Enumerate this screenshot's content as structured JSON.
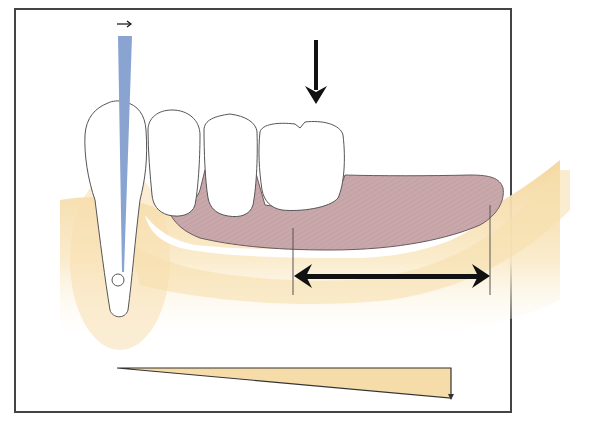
{
  "figure": {
    "colors": {
      "frame": "#444444",
      "bone": "#f6dfae",
      "bone_light": "#fbefd2",
      "denture_base": "#c8a6aa",
      "denture_outline": "#6a5a5e",
      "tooth_fill": "#ffffff",
      "tooth_outline": "#555555",
      "post_blue": "#8aa4d2",
      "arrow": "#111111",
      "wedge_fill": "#f6dca9"
    },
    "elements": {
      "abutment_tooth": "Abutment tooth with root",
      "rotation_arrow": "Small horizontal arrow indicating tipping direction",
      "load_arrow": "Vertical occlusal load arrow",
      "denture_base": "Distal extension denture base",
      "extension_span": "Double-headed arrow showing extension length",
      "stress_wedge": "Wedge showing increasing load/displacement distally"
    }
  }
}
